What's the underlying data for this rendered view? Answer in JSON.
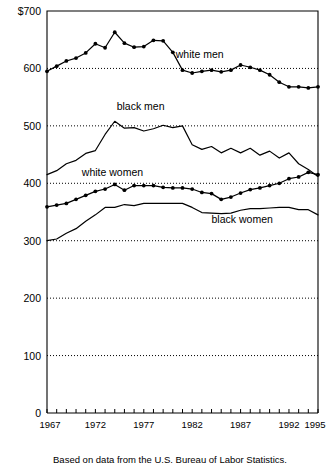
{
  "chart_data": {
    "type": "line",
    "title": "",
    "subtitle": "",
    "xlabel": "",
    "ylabel": "",
    "source_note": "Based on data from the U.S. Bureau of Labor Statistics.",
    "y_axis_top_label": "$700",
    "ylim": [
      0,
      700
    ],
    "xlim": [
      1967,
      1995
    ],
    "grid": "horizontal-dotted",
    "legend_position": "inline-annotations",
    "y_ticks": [
      0,
      100,
      200,
      300,
      400,
      500,
      600,
      700
    ],
    "y_tick_labels": [
      "0",
      "100",
      "200",
      "300",
      "400",
      "500",
      "600",
      "$700"
    ],
    "x_ticks": [
      1967,
      1968,
      1969,
      1970,
      1971,
      1972,
      1973,
      1974,
      1975,
      1976,
      1977,
      1978,
      1979,
      1980,
      1981,
      1982,
      1983,
      1984,
      1985,
      1986,
      1987,
      1988,
      1989,
      1990,
      1991,
      1992,
      1993,
      1994,
      1995
    ],
    "x_tick_labels_shown": [
      "1967",
      "1972",
      "1977",
      "1982",
      "1987",
      "1992",
      "1995"
    ],
    "x": [
      1967,
      1968,
      1969,
      1970,
      1971,
      1972,
      1973,
      1974,
      1975,
      1976,
      1977,
      1978,
      1979,
      1980,
      1981,
      1982,
      1983,
      1984,
      1985,
      1986,
      1987,
      1988,
      1989,
      1990,
      1991,
      1992,
      1993,
      1994,
      1995
    ],
    "series": [
      {
        "name": "white men",
        "label": "white men",
        "markers": true,
        "values": [
          595,
          604,
          613,
          618,
          627,
          643,
          636,
          663,
          644,
          637,
          638,
          649,
          648,
          628,
          597,
          592,
          595,
          597,
          594,
          597,
          606,
          602,
          597,
          589,
          576,
          568,
          568,
          566,
          568
        ]
      },
      {
        "name": "black men",
        "label": "black men",
        "markers": false,
        "values": [
          415,
          422,
          434,
          440,
          452,
          457,
          485,
          508,
          496,
          497,
          491,
          495,
          501,
          497,
          500,
          467,
          459,
          464,
          453,
          461,
          453,
          461,
          449,
          456,
          444,
          453,
          434,
          424,
          412
        ]
      },
      {
        "name": "white women",
        "label": "white women",
        "markers": true,
        "values": [
          359,
          362,
          365,
          372,
          379,
          386,
          390,
          398,
          388,
          396,
          396,
          396,
          393,
          392,
          392,
          390,
          384,
          382,
          372,
          376,
          383,
          389,
          392,
          396,
          400,
          408,
          411,
          419,
          415
        ]
      },
      {
        "name": "black women",
        "label": "black women",
        "markers": false,
        "values": [
          300,
          303,
          313,
          321,
          334,
          345,
          358,
          358,
          363,
          361,
          365,
          365,
          365,
          365,
          365,
          358,
          349,
          348,
          347,
          348,
          353,
          356,
          356,
          357,
          358,
          358,
          354,
          354,
          345
        ]
      }
    ],
    "series_annotations": [
      {
        "label": "white men",
        "x": 1980.3,
        "y": 618
      },
      {
        "label": "black men",
        "x": 1974.2,
        "y": 528
      },
      {
        "label": "white women",
        "x": 1970.6,
        "y": 413
      },
      {
        "label": "black women",
        "x": 1984.0,
        "y": 330
      }
    ]
  }
}
